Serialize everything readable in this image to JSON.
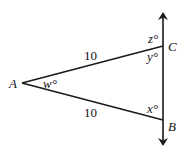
{
  "diagram": {
    "type": "geometry-triangle",
    "stroke_color": "#1a1a1a",
    "vertices": {
      "A": {
        "label": "A",
        "x": 22,
        "y": 83
      },
      "B": {
        "label": "B",
        "x": 163,
        "y": 120
      },
      "C": {
        "label": "C",
        "x": 163,
        "y": 46
      }
    },
    "line": {
      "x": 163,
      "y_top": 13,
      "y_bottom": 145,
      "arrows": "both"
    },
    "sides": {
      "AC": {
        "length_label": "10"
      },
      "AB": {
        "length_label": "10"
      }
    },
    "angles": {
      "w": {
        "label": "w°"
      },
      "x": {
        "label": "x°"
      },
      "y": {
        "label": "y°"
      },
      "z": {
        "label": "z°"
      }
    }
  }
}
